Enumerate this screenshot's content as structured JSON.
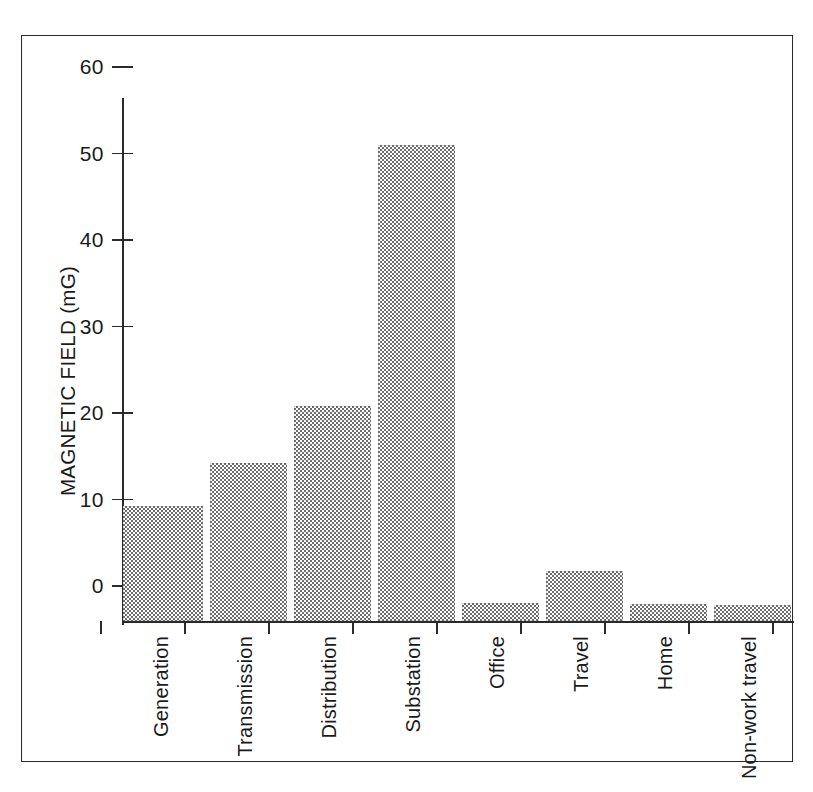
{
  "chart_data": {
    "type": "bar",
    "title": "",
    "subtitle": "",
    "xlabel": "",
    "ylabel": "MAGNETIC FIELD (mG)",
    "ylim": [
      0,
      60
    ],
    "ytick_labels": [
      "0",
      "10",
      "20",
      "30",
      "40",
      "50",
      "60"
    ],
    "ytick_values": [
      0,
      10,
      20,
      30,
      40,
      50,
      60
    ],
    "grid": false,
    "legend": null,
    "annotations": [],
    "categories": [
      "Generation",
      "Transmission",
      "Distribution",
      "Substation",
      "Office",
      "Travel",
      "Home",
      "Non-work travel"
    ],
    "values": [
      13.3,
      18.3,
      24.9,
      55.0,
      2.1,
      5.8,
      2.0,
      1.9
    ],
    "bar_fill": "#6e6e6e",
    "bar_pattern": "checkerboard-dither-50",
    "axis_color": "#2a2a2a",
    "background": "#ffffff"
  },
  "frame": {
    "border_color": "#2a2a2a"
  }
}
